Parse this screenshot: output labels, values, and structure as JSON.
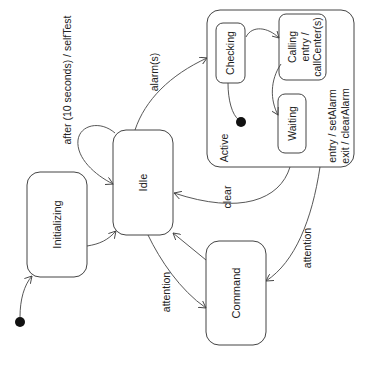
{
  "diagram": {
    "type": "UML state machine (rotated 90° counter-clockwise)",
    "states": {
      "initializing": {
        "label": "Initializing"
      },
      "idle": {
        "label": "Idle"
      },
      "command": {
        "label": "Command"
      },
      "active": {
        "label": "Active",
        "entry": "entry / setAlarm",
        "exit": "exit / clearAlarm",
        "substates": {
          "checking": {
            "label": "Checking"
          },
          "calling": {
            "label": "Calling",
            "entry1": "entry /",
            "entry2": "callCenter(s)"
          },
          "waiting": {
            "label": "Waiting"
          }
        }
      }
    },
    "transitions": {
      "self_test": "after (10 seconds) / selfTest",
      "alarm": "alarm(s)",
      "clear": "clear",
      "attention_idle": "attention",
      "attention_active": "attention"
    }
  }
}
